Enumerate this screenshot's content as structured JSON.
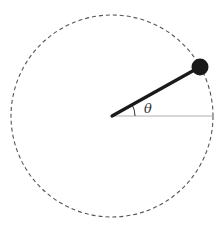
{
  "diagram": {
    "type": "pendulum-circular-motion",
    "angle_label": "θ",
    "colors": {
      "background": "#ffffff",
      "circle_stroke": "#555555",
      "rod": "#1a1a1a",
      "bob": "#1a1a1a",
      "reference_line": "#b0b0b0",
      "angle_arc": "#333333"
    },
    "elements": {
      "circle": {
        "style": "dashed",
        "description": "circular path"
      },
      "rod": {
        "description": "rigid rod from center to bob"
      },
      "bob": {
        "description": "mass at end of rod"
      },
      "reference_line": {
        "description": "horizontal reference from center"
      },
      "angle_arc": {
        "description": "arc indicating angle theta"
      }
    }
  }
}
